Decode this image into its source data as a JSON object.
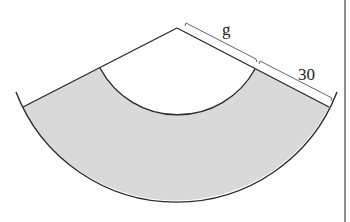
{
  "figure": {
    "labels": {
      "inner_slant": "g",
      "ring_width": "30"
    },
    "colors": {
      "fill": "#d9d9d9",
      "stroke": "#2a2a2a",
      "background": "#ffffff"
    }
  }
}
